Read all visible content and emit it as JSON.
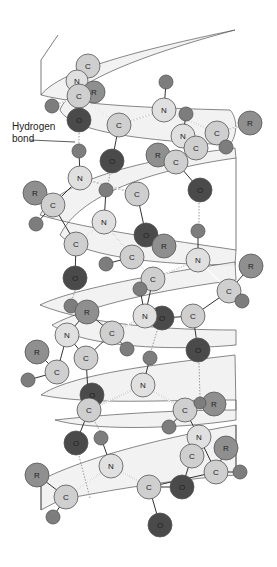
{
  "figure": {
    "title": "",
    "annotation": {
      "line1": "Hydrogen",
      "line2": "bond"
    }
  },
  "legend_colors": {
    "C": "#cfcfcf",
    "N": "#e0e0e0",
    "O": "#4a4a4a",
    "R": "#8f8f8f",
    "H": "#7d7d7d"
  },
  "atoms": [
    {
      "el": "C",
      "x": 88,
      "y": 66,
      "r": 12
    },
    {
      "el": "N",
      "x": 77,
      "y": 81,
      "r": 11
    },
    {
      "el": "R",
      "x": 94,
      "y": 92,
      "r": 11
    },
    {
      "el": "C",
      "x": 79,
      "y": 96,
      "r": 12
    },
    {
      "el": "H",
      "x": 52,
      "y": 106,
      "r": 7
    },
    {
      "el": "O",
      "x": 79,
      "y": 120,
      "r": 12
    },
    {
      "el": "C",
      "x": 119,
      "y": 125,
      "r": 12
    },
    {
      "el": "H",
      "x": 166,
      "y": 82,
      "r": 7
    },
    {
      "el": "N",
      "x": 164,
      "y": 110,
      "r": 12
    },
    {
      "el": "H",
      "x": 186,
      "y": 114,
      "r": 7
    },
    {
      "el": "C",
      "x": 217,
      "y": 133,
      "r": 12
    },
    {
      "el": "R",
      "x": 250,
      "y": 123,
      "r": 12
    },
    {
      "el": "H",
      "x": 226,
      "y": 147,
      "r": 7
    },
    {
      "el": "N",
      "x": 183,
      "y": 136,
      "r": 12
    },
    {
      "el": "C",
      "x": 196,
      "y": 148,
      "r": 12
    },
    {
      "el": "R",
      "x": 158,
      "y": 155,
      "r": 12
    },
    {
      "el": "C",
      "x": 176,
      "y": 162,
      "r": 12
    },
    {
      "el": "H",
      "x": 79,
      "y": 151,
      "r": 7
    },
    {
      "el": "O",
      "x": 112,
      "y": 161,
      "r": 12
    },
    {
      "el": "O",
      "x": 200,
      "y": 190,
      "r": 12
    },
    {
      "el": "N",
      "x": 80,
      "y": 178,
      "r": 12
    },
    {
      "el": "R",
      "x": 35,
      "y": 193,
      "r": 12
    },
    {
      "el": "C",
      "x": 53,
      "y": 205,
      "r": 12
    },
    {
      "el": "H",
      "x": 106,
      "y": 190,
      "r": 7
    },
    {
      "el": "C",
      "x": 137,
      "y": 194,
      "r": 12
    },
    {
      "el": "H",
      "x": 36,
      "y": 224,
      "r": 7
    },
    {
      "el": "N",
      "x": 104,
      "y": 222,
      "r": 12
    },
    {
      "el": "O",
      "x": 146,
      "y": 235,
      "r": 12
    },
    {
      "el": "R",
      "x": 164,
      "y": 246,
      "r": 12
    },
    {
      "el": "H",
      "x": 198,
      "y": 231,
      "r": 7
    },
    {
      "el": "C",
      "x": 76,
      "y": 244,
      "r": 12
    },
    {
      "el": "N",
      "x": 198,
      "y": 260,
      "r": 12
    },
    {
      "el": "C",
      "x": 132,
      "y": 257,
      "r": 12
    },
    {
      "el": "H",
      "x": 106,
      "y": 264,
      "r": 7
    },
    {
      "el": "R",
      "x": 251,
      "y": 266,
      "r": 12
    },
    {
      "el": "C",
      "x": 153,
      "y": 279,
      "r": 12
    },
    {
      "el": "O",
      "x": 75,
      "y": 278,
      "r": 12
    },
    {
      "el": "H",
      "x": 140,
      "y": 289,
      "r": 7
    },
    {
      "el": "C",
      "x": 229,
      "y": 291,
      "r": 12
    },
    {
      "el": "H",
      "x": 242,
      "y": 301,
      "r": 7
    },
    {
      "el": "H",
      "x": 71,
      "y": 306,
      "r": 7
    },
    {
      "el": "R",
      "x": 87,
      "y": 312,
      "r": 12
    },
    {
      "el": "O",
      "x": 162,
      "y": 318,
      "r": 12
    },
    {
      "el": "N",
      "x": 145,
      "y": 316,
      "r": 12
    },
    {
      "el": "C",
      "x": 193,
      "y": 316,
      "r": 12
    },
    {
      "el": "N",
      "x": 67,
      "y": 335,
      "r": 12
    },
    {
      "el": "C",
      "x": 112,
      "y": 333,
      "r": 12
    },
    {
      "el": "H",
      "x": 127,
      "y": 349,
      "r": 7
    },
    {
      "el": "R",
      "x": 37,
      "y": 352,
      "r": 12
    },
    {
      "el": "C",
      "x": 86,
      "y": 358,
      "r": 12
    },
    {
      "el": "O",
      "x": 198,
      "y": 350,
      "r": 12
    },
    {
      "el": "H",
      "x": 150,
      "y": 358,
      "r": 7
    },
    {
      "el": "C",
      "x": 57,
      "y": 372,
      "r": 12
    },
    {
      "el": "H",
      "x": 28,
      "y": 380,
      "r": 7
    },
    {
      "el": "N",
      "x": 143,
      "y": 385,
      "r": 12
    },
    {
      "el": "O",
      "x": 92,
      "y": 395,
      "r": 12
    },
    {
      "el": "C",
      "x": 89,
      "y": 410,
      "r": 12
    },
    {
      "el": "C",
      "x": 185,
      "y": 410,
      "r": 12
    },
    {
      "el": "R",
      "x": 214,
      "y": 404,
      "r": 12
    },
    {
      "el": "H",
      "x": 200,
      "y": 403,
      "r": 6
    },
    {
      "el": "H",
      "x": 169,
      "y": 427,
      "r": 7
    },
    {
      "el": "N",
      "x": 199,
      "y": 437,
      "r": 12
    },
    {
      "el": "O",
      "x": 76,
      "y": 443,
      "r": 12
    },
    {
      "el": "H",
      "x": 101,
      "y": 438,
      "r": 7
    },
    {
      "el": "R",
      "x": 226,
      "y": 448,
      "r": 12
    },
    {
      "el": "C",
      "x": 192,
      "y": 456,
      "r": 12
    },
    {
      "el": "N",
      "x": 111,
      "y": 466,
      "r": 12
    },
    {
      "el": "R",
      "x": 37,
      "y": 475,
      "r": 12
    },
    {
      "el": "C",
      "x": 216,
      "y": 472,
      "r": 12
    },
    {
      "el": "H",
      "x": 240,
      "y": 472,
      "r": 7
    },
    {
      "el": "C",
      "x": 149,
      "y": 487,
      "r": 12
    },
    {
      "el": "O",
      "x": 182,
      "y": 487,
      "r": 12
    },
    {
      "el": "C",
      "x": 66,
      "y": 497,
      "r": 12
    },
    {
      "el": "H",
      "x": 53,
      "y": 517,
      "r": 7
    },
    {
      "el": "O",
      "x": 160,
      "y": 525,
      "r": 12
    }
  ],
  "hydrogen_bonds": [
    [
      79,
      133,
      79,
      144
    ],
    [
      110,
      174,
      110,
      184
    ],
    [
      199,
      203,
      199,
      224
    ],
    [
      75,
      291,
      75,
      302
    ],
    [
      155,
      331,
      152,
      351
    ],
    [
      199,
      363,
      199,
      397
    ],
    [
      99,
      421,
      105,
      431
    ],
    [
      79,
      456,
      90,
      497
    ]
  ]
}
